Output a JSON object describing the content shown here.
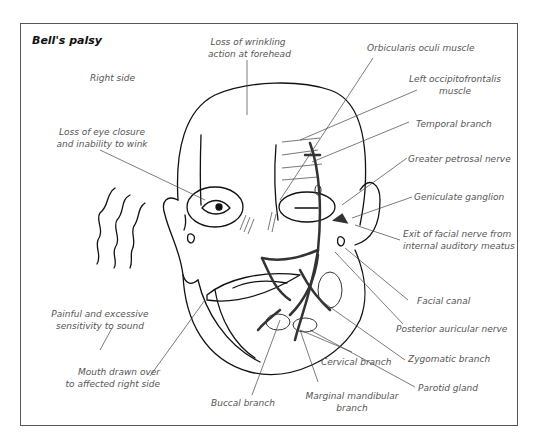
{
  "figure": {
    "title": "Bell's palsy",
    "side_label": "Right side",
    "colors": {
      "outline": "#111111",
      "leader_line": "#444444",
      "label_text": "#555555",
      "nerve": "#333333",
      "frame": "#555555"
    }
  },
  "labels": {
    "forehead": [
      "Loss of wrinkling",
      "action at forehead"
    ],
    "orbicularis": "Orbicularis oculi muscle",
    "occipitofrontalis": [
      "Left occipitofrontalis",
      "muscle"
    ],
    "temporal": "Temporal branch",
    "petrosal": "Greater petrosal nerve",
    "geniculate": "Geniculate ganglion",
    "exit_nerve": [
      "Exit of facial nerve from",
      "internal auditory meatus"
    ],
    "facial_canal": "Facial canal",
    "posterior_auricular": "Posterior auricular nerve",
    "zygomatic": "Zygomatic branch",
    "parotid": "Parotid gland",
    "cervical": "Cervical branch",
    "marginal": [
      "Marginal mandibular",
      "branch"
    ],
    "buccal": "Buccal branch",
    "mouth": [
      "Mouth drawn over",
      "to affected right side"
    ],
    "sound": [
      "Painful and excessive",
      "sensitivity to sound"
    ],
    "eye_closure": [
      "Loss of eye closure",
      "and inability to wink"
    ]
  }
}
